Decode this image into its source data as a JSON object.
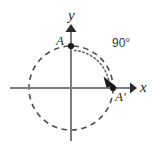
{
  "figure": {
    "width": 153,
    "height": 149,
    "background_color": "#ffffff"
  },
  "colors": {
    "axis": "#7d7d7d",
    "circle": "#4d4d4d",
    "arc": "#6b6b6b",
    "text": "#231f20",
    "point": "#1a1a1a"
  },
  "axes": {
    "x_label": "x",
    "y_label": "y",
    "origin": {
      "x": 71,
      "y": 88
    },
    "x_start": {
      "x": 10,
      "y": 88
    },
    "x_end": {
      "x": 136,
      "y": 88
    },
    "y_start": {
      "x": 71,
      "y": 141
    },
    "y_end": {
      "x": 71,
      "y": 25
    }
  },
  "circle": {
    "center_x": 71,
    "center_y": 88,
    "radius": 42,
    "style": "dashed"
  },
  "points": [
    {
      "name": "A",
      "label": "A",
      "x": 71,
      "y": 46,
      "label_x": 56,
      "label_y": 45
    },
    {
      "name": "A-prime",
      "label": "A'",
      "x": 113,
      "y": 88,
      "label_x": 115,
      "label_y": 101
    }
  ],
  "rotation": {
    "angle_label": "90°",
    "angle_label_x": 112,
    "angle_label_y": 47,
    "direction": "clockwise",
    "arc_radius": 38,
    "arc_style": "dotted",
    "from_point": "A",
    "to_point": "A'"
  }
}
